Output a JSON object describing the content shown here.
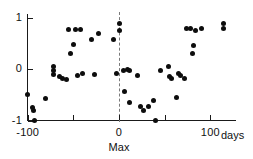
{
  "chart_data": {
    "type": "scatter",
    "title": "",
    "xlabel": "days",
    "ylabel": "",
    "xlim": [
      -110,
      122
    ],
    "ylim": [
      -1.25,
      1.15
    ],
    "grid": false,
    "legend": null,
    "xticks": [
      -100,
      -50,
      0,
      50,
      100
    ],
    "xtick_labels": [
      "-100",
      "",
      "0",
      "",
      "100"
    ],
    "yticks": [
      1,
      0,
      -1
    ],
    "ytick_labels": [
      "1",
      "0",
      "-1"
    ],
    "annotations": [
      {
        "name": "max-reference-line",
        "type": "vline",
        "x": 0,
        "style": "dashed",
        "label": "Max"
      }
    ],
    "points": [
      {
        "x": -100,
        "y": -0.5
      },
      {
        "x": -95,
        "y": -0.74
      },
      {
        "x": -94,
        "y": -0.8
      },
      {
        "x": -93,
        "y": -1.0
      },
      {
        "x": -80,
        "y": -0.58
      },
      {
        "x": -72,
        "y": 0.04
      },
      {
        "x": -72,
        "y": -0.02
      },
      {
        "x": -72,
        "y": -0.1
      },
      {
        "x": -65,
        "y": -0.14
      },
      {
        "x": -62,
        "y": -0.18
      },
      {
        "x": -58,
        "y": -0.2
      },
      {
        "x": -55,
        "y": 0.76
      },
      {
        "x": -53,
        "y": 0.3
      },
      {
        "x": -50,
        "y": 0.47
      },
      {
        "x": -48,
        "y": 0.77
      },
      {
        "x": -45,
        "y": -0.12
      },
      {
        "x": -42,
        "y": 0.76
      },
      {
        "x": -40,
        "y": -0.08
      },
      {
        "x": -30,
        "y": 0.57
      },
      {
        "x": -27,
        "y": -0.1
      },
      {
        "x": -22,
        "y": 0.69
      },
      {
        "x": -6,
        "y": 0.58
      },
      {
        "x": -3,
        "y": -0.09
      },
      {
        "x": 0,
        "y": 0.89
      },
      {
        "x": 0,
        "y": 0.75
      },
      {
        "x": 5,
        "y": -0.02
      },
      {
        "x": 6,
        "y": -0.43
      },
      {
        "x": 9,
        "y": 0.0
      },
      {
        "x": 11,
        "y": -0.02
      },
      {
        "x": 12,
        "y": -0.65
      },
      {
        "x": 20,
        "y": -0.12
      },
      {
        "x": 24,
        "y": -0.73
      },
      {
        "x": 27,
        "y": -0.8
      },
      {
        "x": 32,
        "y": -0.72
      },
      {
        "x": 38,
        "y": -0.62
      },
      {
        "x": 40,
        "y": -1.0
      },
      {
        "x": 46,
        "y": -0.02
      },
      {
        "x": 54,
        "y": 0.05
      },
      {
        "x": 55,
        "y": -0.14
      },
      {
        "x": 58,
        "y": -0.18
      },
      {
        "x": 63,
        "y": -0.56
      },
      {
        "x": 65,
        "y": -0.09
      },
      {
        "x": 67,
        "y": -0.12
      },
      {
        "x": 72,
        "y": -0.18
      },
      {
        "x": 74,
        "y": 0.78
      },
      {
        "x": 78,
        "y": 0.79
      },
      {
        "x": 80,
        "y": 0.3
      },
      {
        "x": 82,
        "y": 0.46
      },
      {
        "x": 84,
        "y": 0.75
      },
      {
        "x": 90,
        "y": 0.79
      },
      {
        "x": 114,
        "y": 0.88
      },
      {
        "x": 115,
        "y": 0.78
      }
    ]
  }
}
